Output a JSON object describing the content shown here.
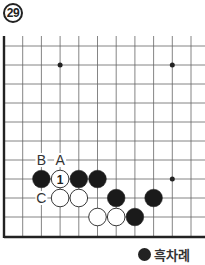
{
  "problem": {
    "number": "29"
  },
  "board": {
    "grid": {
      "x0": 4,
      "dx": 18.7,
      "y0": 46,
      "dy": 19,
      "cols": 11,
      "rows": 10,
      "bottom": 237,
      "right": 205
    },
    "hoshi": [
      {
        "col": 3,
        "row": 1
      },
      {
        "col": 9,
        "row": 1
      },
      {
        "col": 9,
        "row": 7
      }
    ],
    "stones": [
      {
        "color": "black",
        "col": 2,
        "row": 7
      },
      {
        "color": "white",
        "col": 3,
        "row": 7,
        "label": "1"
      },
      {
        "color": "black",
        "col": 4,
        "row": 7
      },
      {
        "color": "black",
        "col": 5,
        "row": 7
      },
      {
        "color": "white",
        "col": 3,
        "row": 8
      },
      {
        "color": "white",
        "col": 4,
        "row": 8
      },
      {
        "color": "black",
        "col": 6,
        "row": 8
      },
      {
        "color": "black",
        "col": 8,
        "row": 8
      },
      {
        "color": "white",
        "col": 5,
        "row": 9
      },
      {
        "color": "white",
        "col": 6,
        "row": 9
      },
      {
        "color": "black",
        "col": 7,
        "row": 9
      }
    ],
    "labels": [
      {
        "text": "B",
        "col": 2,
        "row": 6
      },
      {
        "text": "A",
        "col": 3,
        "row": 6
      },
      {
        "text": "C",
        "col": 2,
        "row": 8
      }
    ]
  },
  "caption": {
    "text": "흑차례",
    "stone_color": "black"
  }
}
